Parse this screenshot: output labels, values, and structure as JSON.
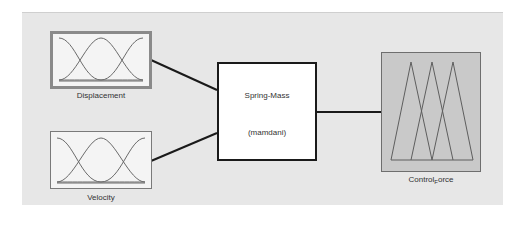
{
  "diagram": {
    "inputs": [
      {
        "name": "Displacement",
        "mf_type": "gaussian",
        "mf_count": 3,
        "selected": true
      },
      {
        "name": "Velocity",
        "mf_type": "gaussian",
        "mf_count": 3,
        "selected": false
      }
    ],
    "system": {
      "name": "Spring-Mass",
      "type": "(mamdani)"
    },
    "output": {
      "name_prefix": "Control",
      "name_sub": "F",
      "name_suffix": "orce",
      "name_full": "Control_Force",
      "mf_type": "triangular",
      "mf_count": 3
    },
    "colors": {
      "panel": "#e7e7e7",
      "input_fill": "#f4f4f4",
      "output_fill": "#c9c9c9",
      "rule_fill": "#ffffff",
      "wire": "#1a1a1a",
      "curve": "#6a6a6a"
    }
  }
}
